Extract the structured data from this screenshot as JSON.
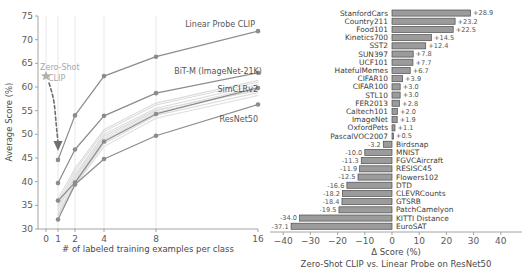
{
  "chart_data": [
    {
      "id": "left",
      "type": "line",
      "title": "",
      "xlabel": "# of labeled training examples per class",
      "ylabel": "Average Score (%)",
      "xticks": [
        0,
        1,
        2,
        4,
        8,
        16
      ],
      "yticks": [
        30,
        35,
        40,
        45,
        50,
        55,
        60,
        65,
        70,
        75
      ],
      "xlim": [
        0,
        16
      ],
      "ylim": [
        30,
        75
      ],
      "xscale": "log2-like",
      "grid": "vertical",
      "legend_position": "inline-annotations",
      "zero_shot": {
        "label_line1": "Zero-Shot",
        "label_line2": "CLIP",
        "marker": "star",
        "x": 0,
        "y": 62.3
      },
      "series": [
        {
          "name": "Linear Probe CLIP",
          "labeled": true,
          "x": [
            1,
            2,
            4,
            8,
            16
          ],
          "values": [
            44.6,
            54.0,
            62.3,
            66.4,
            71.8
          ]
        },
        {
          "name": "BiT-M (ImageNet-21K)",
          "labeled": true,
          "x": [
            1,
            2,
            4,
            8,
            16
          ],
          "values": [
            39.7,
            46.8,
            53.9,
            58.7,
            63.0
          ]
        },
        {
          "name": "SimCLRv2",
          "labeled": true,
          "x": [
            1,
            2,
            4,
            8,
            16
          ],
          "values": [
            36.0,
            39.8,
            48.5,
            54.3,
            59.8
          ]
        },
        {
          "name": "ResNet50",
          "labeled": true,
          "x": [
            1,
            2,
            4,
            8,
            16
          ],
          "values": [
            32.0,
            39.4,
            44.8,
            49.7,
            56.3
          ]
        },
        {
          "name": "other-1",
          "labeled": false,
          "x": [
            1,
            2,
            4,
            8,
            16
          ],
          "values": [
            35.0,
            41.5,
            50.0,
            55.5,
            60.5
          ]
        },
        {
          "name": "other-2",
          "labeled": false,
          "x": [
            1,
            2,
            4,
            8,
            16
          ],
          "values": [
            34.2,
            40.6,
            49.2,
            55.0,
            60.0
          ]
        },
        {
          "name": "other-3",
          "labeled": false,
          "x": [
            1,
            2,
            4,
            8,
            16
          ],
          "values": [
            33.4,
            40.0,
            48.8,
            54.6,
            59.4
          ]
        },
        {
          "name": "other-4",
          "labeled": false,
          "x": [
            1,
            2,
            4,
            8,
            16
          ],
          "values": [
            32.8,
            39.6,
            48.0,
            54.0,
            58.8
          ]
        },
        {
          "name": "other-5",
          "labeled": false,
          "x": [
            1,
            2,
            4,
            8,
            16
          ],
          "values": [
            35.6,
            42.2,
            50.6,
            56.2,
            61.0
          ]
        },
        {
          "name": "other-6",
          "labeled": false,
          "x": [
            1,
            2,
            4,
            8,
            16
          ],
          "values": [
            33.0,
            39.2,
            47.4,
            53.4,
            58.2
          ]
        },
        {
          "name": "other-7",
          "labeled": false,
          "x": [
            1,
            2,
            4,
            8,
            16
          ],
          "values": [
            36.4,
            42.8,
            51.0,
            56.6,
            61.4
          ]
        },
        {
          "name": "other-8",
          "labeled": false,
          "x": [
            1,
            2,
            4,
            8,
            16
          ],
          "values": [
            34.8,
            41.0,
            49.6,
            55.2,
            59.2
          ]
        }
      ]
    },
    {
      "id": "right",
      "type": "bar",
      "orientation": "horizontal",
      "title": "",
      "xlabel": "Δ Score (%)",
      "subtitle": "Zero-Shot CLIP vs. Linear Probe on ResNet50",
      "xticks": [
        -40,
        -30,
        -20,
        -10,
        0,
        10,
        20,
        30,
        40
      ],
      "xlim": [
        -44,
        44
      ],
      "grid": "none",
      "categories": [
        "StanfordCars",
        "Country211",
        "Food101",
        "Kinetics700",
        "SST2",
        "SUN397",
        "UCF101",
        "HatefulMemes",
        "CIFAR10",
        "CIFAR100",
        "STL10",
        "FER2013",
        "Caltech101",
        "ImageNet",
        "OxfordPets",
        "PascalVOC2007",
        "Birdsnap",
        "MNIST",
        "FGVCAircraft",
        "RESISC45",
        "Flowers102",
        "DTD",
        "CLEVRCounts",
        "GTSRB",
        "PatchCamelyon",
        "KITTI Distance",
        "EuroSAT"
      ],
      "values": [
        28.9,
        23.2,
        22.5,
        14.5,
        12.4,
        7.8,
        7.7,
        6.7,
        3.9,
        3.0,
        3.0,
        2.8,
        2.0,
        1.9,
        1.1,
        0.5,
        -3.2,
        -10.0,
        -11.3,
        -11.9,
        -12.5,
        -16.6,
        -18.2,
        -18.4,
        -19.5,
        -34.0,
        -37.1
      ],
      "value_labels": [
        "+28.9",
        "+23.2",
        "+22.5",
        "+14.5",
        "+12.4",
        "+7.8",
        "+7.7",
        "+6.7",
        "+3.9",
        "+3.0",
        "+3.0",
        "+2.8",
        "+2.0",
        "+1.9",
        "+1.1",
        "+0.5",
        "-3.2",
        "-10.0",
        "-11.3",
        "-11.9",
        "-12.5",
        "-16.6",
        "-18.2",
        "-18.4",
        "-19.5",
        "-34.0",
        "-37.1"
      ]
    }
  ],
  "colors": {
    "bar_fill": "#9b9b9b",
    "bar_edge": "#4d4d4d",
    "main_line": "#8c8c8c",
    "faint_line": "#dcdcdc",
    "annotation": "#a8a8a8",
    "text": "#4a4a4a"
  }
}
